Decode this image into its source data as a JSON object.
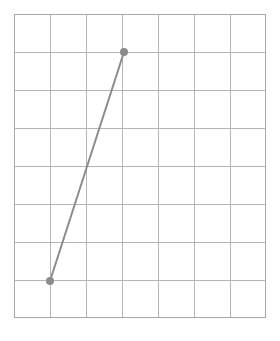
{
  "figure": {
    "title": "Line segment plotted on a square grid",
    "background_color": "#ffffff",
    "width": 280,
    "height": 341
  },
  "grid": {
    "name": "square-grid",
    "columns": 7,
    "rows": 8,
    "line_color": "#b4b4b4",
    "border_color": "#a8a8a8",
    "line_width": 1,
    "origin_x": 14,
    "origin_y": 14,
    "cell_width": 36,
    "cell_height": 38,
    "x_lines": [
      14,
      50,
      86,
      122,
      158,
      194,
      230,
      266
    ],
    "y_lines": [
      14,
      52,
      90,
      128,
      166,
      204,
      242,
      280,
      318
    ]
  },
  "chart_data": {
    "type": "line",
    "xlabel": "",
    "ylabel": "",
    "grid": true,
    "legend": "none",
    "xlim": [
      0,
      7
    ],
    "ylim": [
      0,
      8
    ],
    "series": [
      {
        "name": "segment",
        "color": "#8c8c8c",
        "line_width": 2,
        "marker": "circle",
        "marker_radius": 4,
        "marker_color": "#8c8c8c",
        "x": [
          1,
          3
        ],
        "y": [
          1,
          7
        ],
        "points_px": [
          {
            "label": "lower-left-endpoint",
            "x": 50,
            "y": 281
          },
          {
            "label": "upper-right-endpoint",
            "x": 124,
            "y": 52
          }
        ]
      }
    ]
  },
  "markers": {
    "start_label": "segment-endpoint-lower",
    "end_label": "segment-endpoint-upper"
  }
}
